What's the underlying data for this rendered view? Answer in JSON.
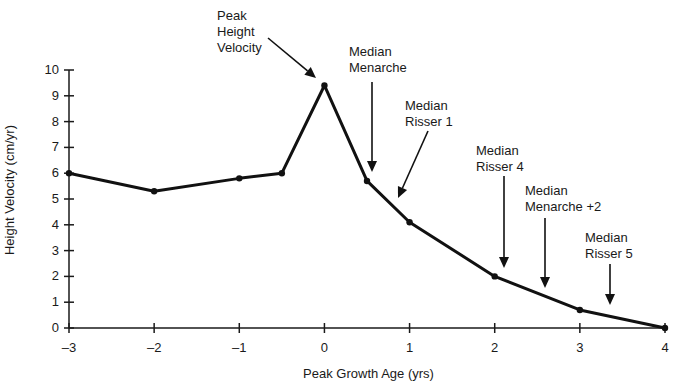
{
  "chart_data": {
    "type": "line",
    "title": "",
    "xlabel": "Peak Growth Age (yrs)",
    "ylabel": "Height Velocity (cm/yr)",
    "xlim": [
      -3,
      4
    ],
    "ylim": [
      0,
      10
    ],
    "x_ticks": [
      "-3",
      "-2",
      "-1",
      "0",
      "1",
      "2",
      "3",
      "4"
    ],
    "y_ticks": [
      "0",
      "1",
      "2",
      "3",
      "4",
      "5",
      "6",
      "7",
      "8",
      "9",
      "10"
    ],
    "grid": false,
    "series": [
      {
        "name": "Height Velocity",
        "x": [
          -3,
          -2,
          -1,
          -0.5,
          0,
          0.5,
          1,
          2,
          3,
          4
        ],
        "values": [
          6.0,
          5.3,
          5.8,
          6.0,
          9.4,
          5.7,
          4.1,
          2.0,
          0.7,
          0.0
        ]
      }
    ],
    "annotations": [
      {
        "text": "Peak\nHeight\nVelocity",
        "x": 0,
        "y": 9.4
      },
      {
        "text": "Median\nMenarche",
        "x": 0.5,
        "y": 5.7
      },
      {
        "text": "Median\nRisser 1",
        "x": 0.85,
        "y": 4.4
      },
      {
        "text": "Median\nRisser 4",
        "x": 2.15,
        "y": 2.1
      },
      {
        "text": "Median\nMenarche +2",
        "x": 2.6,
        "y": 1.5
      },
      {
        "text": "Median\nRisser 5",
        "x": 3.4,
        "y": 0.8
      }
    ]
  }
}
